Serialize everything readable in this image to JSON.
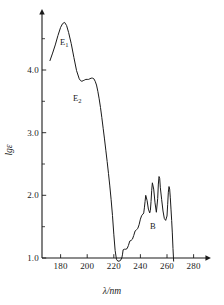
{
  "chart_data": {
    "type": "line",
    "title": "",
    "xlabel": "λ/nm",
    "ylabel": "lgε",
    "xlim": [
      170,
      290
    ],
    "ylim": [
      0.85,
      5.0
    ],
    "xticks": [
      180,
      200,
      220,
      240,
      260,
      280
    ],
    "xtick_labels": [
      "180",
      "200",
      "220",
      "240",
      "260",
      "280"
    ],
    "yticks": [
      1.0,
      2.0,
      3.0,
      4.0
    ],
    "ytick_labels": [
      "1.0",
      "2.0",
      "3.0",
      "4.0"
    ],
    "yminorticks": [
      1.5,
      2.5,
      3.5,
      4.5
    ],
    "grid": false,
    "legend": null,
    "line_color": "#1a1a1a",
    "axis_color": "#1a1a1a",
    "annotations": [
      {
        "id": "e1",
        "text": "E",
        "subscript": "1",
        "lambda": 183,
        "lg_epsilon": 4.45
      },
      {
        "id": "e2",
        "text": "E",
        "subscript": "2",
        "lambda": 198,
        "lg_epsilon": 3.55
      },
      {
        "id": "b",
        "text": "B",
        "subscript": "",
        "lambda": 252,
        "lg_epsilon": 1.58
      }
    ],
    "series": [
      {
        "name": "benzene absorption spectrum",
        "x": [
          172,
          174,
          176,
          178,
          180,
          181.5,
          183,
          184.5,
          186,
          188,
          190,
          192,
          194,
          195,
          196,
          197,
          198,
          199,
          200,
          201,
          202,
          203,
          204,
          205,
          206,
          207,
          208,
          209,
          210,
          211,
          212,
          213,
          214,
          215,
          216,
          217,
          218,
          219,
          220,
          221,
          222,
          223,
          224,
          225,
          226,
          226.5,
          227,
          228,
          229,
          230,
          231,
          232,
          233,
          234,
          235,
          236,
          237,
          238,
          239,
          240,
          241,
          242,
          242.5,
          243,
          243.5,
          244,
          245,
          246,
          247,
          247.5,
          248,
          248.5,
          249,
          250,
          251,
          252,
          253,
          253.5,
          254,
          254.5,
          255,
          256,
          257,
          258,
          259,
          260,
          260.5,
          261,
          261.5,
          262,
          262.5,
          263,
          263.5,
          264,
          264.5,
          265
        ],
        "y": [
          4.15,
          4.27,
          4.4,
          4.55,
          4.68,
          4.74,
          4.76,
          4.71,
          4.6,
          4.42,
          4.2,
          3.99,
          3.86,
          3.83,
          3.82,
          3.83,
          3.84,
          3.85,
          3.85,
          3.85,
          3.86,
          3.87,
          3.87,
          3.86,
          3.82,
          3.76,
          3.66,
          3.54,
          3.4,
          3.24,
          3.07,
          2.9,
          2.72,
          2.54,
          2.35,
          2.15,
          1.93,
          1.68,
          1.38,
          1.12,
          0.98,
          0.95,
          0.95,
          0.96,
          1.0,
          1.05,
          1.13,
          1.14,
          1.14,
          1.15,
          1.2,
          1.27,
          1.28,
          1.3,
          1.36,
          1.43,
          1.45,
          1.47,
          1.53,
          1.62,
          1.68,
          1.7,
          1.72,
          1.8,
          1.9,
          2.0,
          1.92,
          1.78,
          1.72,
          1.76,
          1.9,
          2.08,
          2.2,
          2.1,
          1.88,
          1.73,
          1.95,
          2.18,
          2.3,
          2.27,
          2.12,
          1.93,
          1.75,
          1.63,
          1.6,
          1.67,
          1.85,
          2.05,
          2.14,
          2.1,
          1.96,
          1.78,
          1.6,
          1.4,
          1.15,
          0.95
        ]
      }
    ]
  },
  "axes": {
    "x_title": "λ/nm",
    "y_title": "lgε",
    "x_tick_labels": [
      "180",
      "200",
      "220",
      "240",
      "260",
      "280"
    ],
    "y_tick_labels": [
      "1.0",
      "2.0",
      "3.0",
      "4.0"
    ]
  },
  "labels": {
    "e1_base": "E",
    "e1_sub": "1",
    "e2_base": "E",
    "e2_sub": "2",
    "b": "B"
  }
}
